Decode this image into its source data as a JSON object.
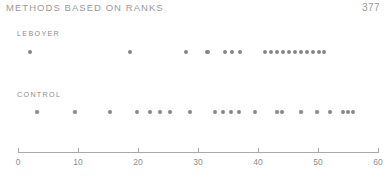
{
  "header": {
    "running_head": "METHODS BASED ON RANKS",
    "page_number": "377"
  },
  "chart_data": {
    "type": "scatter",
    "title": "",
    "xlabel": "",
    "ylabel": "",
    "xlim": [
      0,
      60
    ],
    "ylim": [
      0,
      1
    ],
    "grid": false,
    "legend_position": "inline-left",
    "axis": {
      "ticks": [
        0,
        10,
        20,
        30,
        40,
        50,
        60
      ],
      "tick_labels": [
        "0",
        "10",
        "20",
        "30",
        "40",
        "50",
        "60"
      ]
    },
    "series": [
      {
        "name": "LEBOYER",
        "label": "LEBOYER",
        "values": [
          2,
          18.7,
          28,
          31.5,
          34.5,
          35.7,
          37,
          41.2,
          42.2,
          43.2,
          44.2,
          45.2,
          46.2,
          47.2,
          48.2,
          49.2,
          50.2,
          51,
          31.7
        ]
      },
      {
        "name": "CONTROL",
        "label": "CONTROL",
        "values": [
          3.2,
          9.5,
          15.3,
          19.8,
          22,
          23.7,
          25.3,
          28.7,
          32.8,
          34.2,
          35.5,
          36.8,
          39.5,
          43.2,
          44,
          47.2,
          49.8,
          52,
          54.2,
          55,
          55.8
        ]
      }
    ],
    "dot_color": "#868686",
    "axis_color": "#a9a9a9"
  }
}
